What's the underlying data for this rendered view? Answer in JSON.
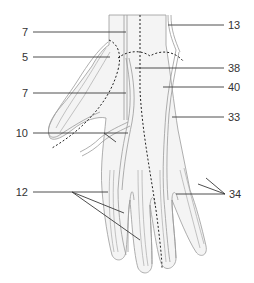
{
  "figure": {
    "colors": {
      "outline": "#9a9a9a",
      "leader_line": "#3a3a3a",
      "dashed": "#222222",
      "skin_shade": "#f3f3f3",
      "label_text": "#333333"
    }
  },
  "labels": {
    "left": [
      {
        "text": "7",
        "x": 12,
        "y": 26
      },
      {
        "text": "5",
        "x": 12,
        "y": 51
      },
      {
        "text": "7",
        "x": 12,
        "y": 87
      },
      {
        "text": "10",
        "x": 12,
        "y": 127
      },
      {
        "text": "12",
        "x": 12,
        "y": 186
      }
    ],
    "right": [
      {
        "text": "13",
        "x": 228,
        "y": 19
      },
      {
        "text": "38",
        "x": 228,
        "y": 62
      },
      {
        "text": "40",
        "x": 228,
        "y": 81
      },
      {
        "text": "33",
        "x": 228,
        "y": 111
      },
      {
        "text": "34",
        "x": 229,
        "y": 188
      }
    ]
  }
}
